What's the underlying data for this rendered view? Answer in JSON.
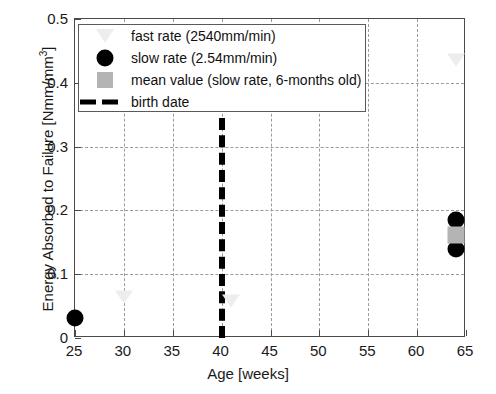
{
  "chart_data": {
    "type": "scatter",
    "title": "",
    "xlabel": "Age [weeks]",
    "ylabel": "Energy Absorbed to Failure [Nmm/mm",
    "ylabel_superscript": "3",
    "ylabel_suffix": "]",
    "xlim": [
      25,
      65
    ],
    "ylim": [
      0,
      0.5
    ],
    "xticks": [
      25,
      30,
      35,
      40,
      45,
      50,
      55,
      60,
      65
    ],
    "xticklabels": [
      "25",
      "30",
      "35",
      "40",
      "45",
      "50",
      "55",
      "60",
      "65"
    ],
    "yticks": [
      0,
      0.1,
      0.2,
      0.3,
      0.4,
      0.5
    ],
    "yticklabels": [
      "0",
      "0.1",
      "0.2",
      "0.3",
      "0.4",
      "0.5"
    ],
    "grid": true,
    "grid_style": "dashed",
    "legend_position": "upper-left",
    "series": [
      {
        "name": "fast rate (2540mm/min)",
        "marker": "triangle-down",
        "color": "#ededed",
        "points": [
          {
            "x": 30,
            "y": 0.065
          },
          {
            "x": 41,
            "y": 0.058
          },
          {
            "x": 64,
            "y": 0.435
          }
        ]
      },
      {
        "name": "slow rate (2.54mm/min)",
        "marker": "circle",
        "color": "#000000",
        "points": [
          {
            "x": 25,
            "y": 0.031
          },
          {
            "x": 64,
            "y": 0.185
          },
          {
            "x": 64,
            "y": 0.139
          }
        ]
      },
      {
        "name": "mean value (slow rate, 6-months old)",
        "marker": "square",
        "color": "#b4b4b4",
        "points": [
          {
            "x": 64,
            "y": 0.162
          }
        ]
      }
    ],
    "annotations": [
      {
        "name": "birth date",
        "type": "vline",
        "x": 40,
        "y_from": 0,
        "y_to": 0.345,
        "style": "dashed",
        "color": "#000000",
        "linewidth": 6
      }
    ]
  },
  "legend": {
    "items": [
      {
        "label": "fast rate (2540mm/min)",
        "symbol": "triangle-down-icon",
        "color": "#ededed"
      },
      {
        "label": "slow rate (2.54mm/min)",
        "symbol": "circle-icon",
        "color": "#000000"
      },
      {
        "label": "mean value (slow rate, 6-months old)",
        "symbol": "square-icon",
        "color": "#b4b4b4"
      },
      {
        "label": "birth date",
        "symbol": "dashed-line-icon",
        "color": "#000000"
      }
    ]
  },
  "axes": {
    "x_title": "Age [weeks]",
    "y_title_main": "Energy Absorbed to Failure [Nmm/mm",
    "y_title_sup": "3",
    "y_title_end": "]"
  },
  "colors": {
    "axis": "#4a4a4a",
    "grid": "#9b9b9b",
    "marker_dark": "#000000",
    "marker_gray": "#b4b4b4",
    "marker_faint": "#ededed",
    "background": "#ffffff"
  }
}
